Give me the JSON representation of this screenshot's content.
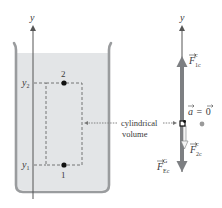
{
  "diagram": {
    "left_panel": {
      "axis_label": "y",
      "point_top": {
        "label": "2",
        "level_label": "y",
        "level_sub": "2"
      },
      "point_bottom": {
        "label": "1",
        "level_label": "y",
        "level_sub": "1"
      },
      "annotation": {
        "line1": "cylindrical",
        "line2": "volume"
      }
    },
    "right_panel": {
      "axis_label": "y",
      "forces": [
        {
          "name": "F",
          "sup": "c",
          "sub": "1c",
          "direction": "up"
        },
        {
          "name": "F",
          "sup": "c",
          "sub": "2c",
          "direction": "down"
        },
        {
          "name": "F",
          "sup": "G",
          "sub": "Ec",
          "direction": "down"
        }
      ],
      "acceleration": {
        "lhs": "a",
        "eq": "=",
        "rhs": "0"
      }
    },
    "colors": {
      "liquid": "#e3e5e7",
      "beaker_wall": "#9a9c9e",
      "force_arrow": "#7d7f82",
      "axis": "#555555",
      "dot": "#9a9a9a"
    }
  }
}
